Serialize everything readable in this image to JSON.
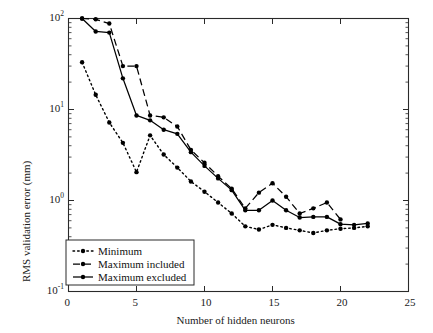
{
  "chart_data": {
    "type": "line",
    "title": "",
    "xlabel": "Number of hidden neurons",
    "ylabel": "RMS validation error (mm)",
    "xlim": [
      0,
      25
    ],
    "ylim": [
      0.1,
      100
    ],
    "yscale": "log",
    "xscale": "linear",
    "grid": false,
    "xticks": [
      0,
      5,
      10,
      15,
      20,
      25
    ],
    "xtick_labels": [
      "0",
      "5",
      "10",
      "15",
      "20",
      "25"
    ],
    "yticks": [
      0.1,
      1,
      10,
      100
    ],
    "ytick_labels": [
      "10-1",
      "100",
      "101",
      "102"
    ],
    "ytick_exponents": [
      "-1",
      "0",
      "1",
      "2"
    ],
    "ytick_mantissa": "10",
    "legend_position": "lower left",
    "series": [
      {
        "name": "Minimum",
        "style": "dotted",
        "marker": "dot",
        "color": "#000000",
        "x": [
          1,
          2,
          3,
          4,
          5,
          6,
          7,
          8,
          9,
          10,
          11,
          12,
          13,
          14,
          15,
          16,
          17,
          18,
          19,
          20,
          21,
          22
        ],
        "y": [
          33,
          14.5,
          7.2,
          4.3,
          2.05,
          5.2,
          3.2,
          2.3,
          1.62,
          1.25,
          0.95,
          0.72,
          0.52,
          0.48,
          0.54,
          0.5,
          0.47,
          0.44,
          0.47,
          0.49,
          0.5,
          0.52
        ]
      },
      {
        "name": "Maximum included",
        "style": "dashed",
        "marker": "dot",
        "color": "#000000",
        "x": [
          1,
          2,
          3,
          4,
          5,
          6,
          7,
          8,
          9,
          10,
          11,
          12,
          13,
          14,
          15,
          16,
          17,
          18,
          19,
          20
        ],
        "y": [
          100,
          98,
          88,
          30,
          30,
          8.6,
          8.2,
          6.5,
          3.6,
          2.6,
          1.85,
          1.35,
          0.82,
          1.22,
          1.55,
          1.1,
          0.72,
          0.82,
          0.95,
          0.62
        ]
      },
      {
        "name": "Maximum excluded",
        "style": "solid",
        "marker": "dot",
        "color": "#000000",
        "x": [
          1,
          2,
          3,
          4,
          5,
          6,
          7,
          8,
          9,
          10,
          11,
          12,
          13,
          14,
          15,
          16,
          17,
          18,
          19,
          20,
          21,
          22
        ],
        "y": [
          100,
          72,
          70,
          22,
          8.6,
          7.6,
          6.0,
          5.4,
          3.4,
          2.4,
          1.75,
          1.3,
          0.78,
          0.78,
          1.0,
          0.78,
          0.65,
          0.66,
          0.66,
          0.55,
          0.54,
          0.56
        ]
      }
    ]
  }
}
